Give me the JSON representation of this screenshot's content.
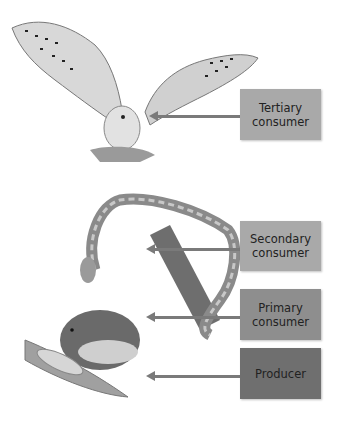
{
  "diagram": {
    "levels": [
      {
        "label": "Tertiary consumer",
        "line1": "Tertiary",
        "line2": "consumer",
        "organism": "owl",
        "color": "#a9a9a9"
      },
      {
        "label": "Secondary consumer",
        "line1": "Secondary",
        "line2": "consumer",
        "organism": "snake",
        "color": "#a9a9a9"
      },
      {
        "label": "Primary consumer",
        "line1": "Primary",
        "line2": "consumer",
        "organism": "mouse",
        "color": "#8e8e8e"
      },
      {
        "label": "Producer",
        "line1": "Producer",
        "line2": "",
        "organism": "corn",
        "color": "#6f6f6f"
      }
    ]
  }
}
